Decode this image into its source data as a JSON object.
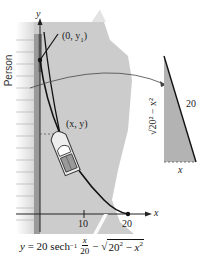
{
  "diagram": {
    "title_formula": {
      "lhs": "y",
      "coef": "20",
      "func": "sech",
      "func_sup": "−1",
      "frac_num": "x",
      "frac_den": "20",
      "minus": "−",
      "radicand_base": "20",
      "radicand_exp": "2",
      "radicand_minus": " − ",
      "radicand_var": "x",
      "radicand_var_exp": "2"
    },
    "axes": {
      "x_label": "x",
      "y_label": "y",
      "x_ticks": [
        "10",
        "20"
      ]
    },
    "points": {
      "start_label": "(0, y",
      "start_sub": "1",
      "start_close": ")",
      "boat_label": "(x, y)"
    },
    "person_label": "Person",
    "triangle": {
      "hypotenuse_label": "20",
      "base_label": "x",
      "vertical_label": "√20² − x²"
    },
    "colors": {
      "water": "#c9c9c9",
      "water_light": "#e6e6e6",
      "triangle_fill": "#b3b3b3",
      "dock": "#9a9a9a",
      "curve": "#111111"
    }
  }
}
